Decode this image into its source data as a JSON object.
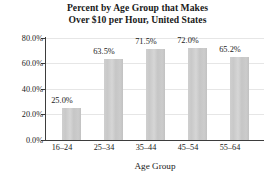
{
  "chart_data": {
    "type": "bar",
    "title": "Percent by Age Group that Makes Over $10 per Hour, United States",
    "title_lines": [
      "Percent by Age Group that Makes",
      "Over $10 per Hour, United States"
    ],
    "xlabel": "Age Group",
    "ylabel": "",
    "categories": [
      "16–24",
      "25–34",
      "35–44",
      "45–54",
      "55–64"
    ],
    "values": [
      25.0,
      63.5,
      71.5,
      72.0,
      65.2
    ],
    "value_labels": [
      "25.0%",
      "63.5%",
      "71.5%",
      "72.0%",
      "65.2%"
    ],
    "ylim": [
      0,
      80
    ],
    "ytick_values": [
      0,
      20,
      40,
      60,
      80
    ],
    "ytick_labels": [
      "0.0%",
      "20.0%",
      "40.0%",
      "60.0%",
      "80.0%"
    ],
    "grid": true,
    "legend": false,
    "bar_color": "#cccccc",
    "axis_color": "#3d3d3d",
    "gridline_color": "#e6e6e6",
    "background_color": "#ffffff"
  }
}
